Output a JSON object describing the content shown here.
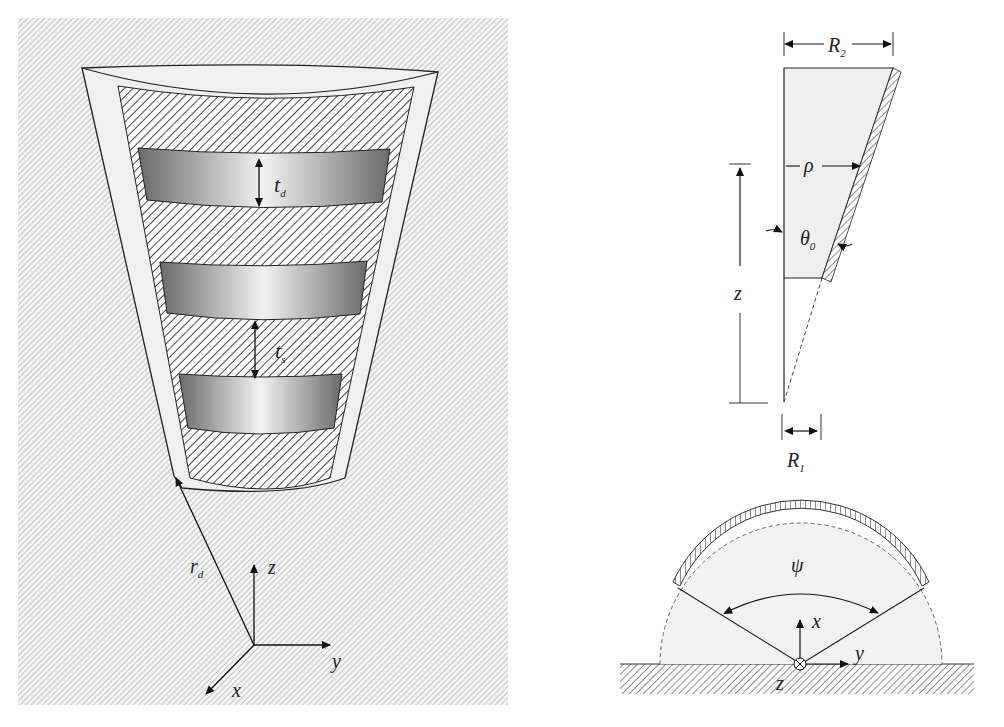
{
  "figure": {
    "left_panel": {
      "description": "3D view of tapered trench with dielectric strips",
      "labels": {
        "td": "t",
        "td_sub": "d",
        "ts": "t",
        "ts_sub": "s",
        "rd": "r",
        "rd_sub": "d",
        "axis_z": "z",
        "axis_y": "y",
        "axis_x": "x"
      }
    },
    "top_right_panel": {
      "description": "Side cross-section of wedge",
      "labels": {
        "R2": "R",
        "R2_sub": "2",
        "rho": "ρ",
        "theta0": "θ",
        "theta0_sub": "0",
        "z": "z",
        "R1": "R",
        "R1_sub": "1"
      }
    },
    "bottom_right_panel": {
      "description": "Top cross-section showing sector angle",
      "labels": {
        "psi": "ψ",
        "axis_x": "x",
        "axis_y": "y",
        "axis_z": "z",
        "z_symbol": "⊗"
      }
    }
  },
  "colors": {
    "hatch_bg": "#c8c8c8",
    "light_fill": "#efefef",
    "stroke": "#222222"
  }
}
